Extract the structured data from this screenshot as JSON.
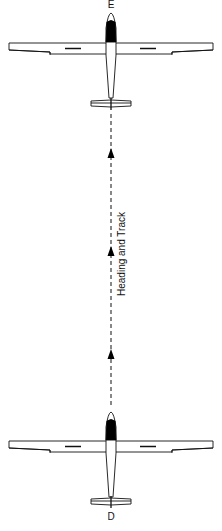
{
  "diagram": {
    "title": "Heading and Track",
    "track_label": "Heading and Track",
    "gliders": [
      {
        "name": "glider-top",
        "position_label": "E",
        "nose_y": 13,
        "wing_y": 43
      },
      {
        "name": "glider-bottom",
        "position_label": "D",
        "nose_y": 412,
        "wing_y": 440
      }
    ],
    "track_arrows": 3,
    "colors": {
      "line": "#111111",
      "canopy": "#000000",
      "background": "#ffffff"
    }
  }
}
